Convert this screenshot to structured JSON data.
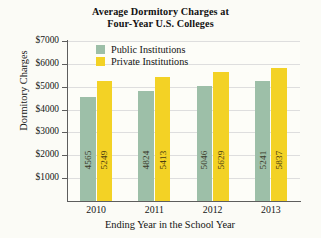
{
  "chart_data": {
    "type": "bar",
    "title": "Average Dormitory Charges at Four-Year U.S. Colleges",
    "title_line1": "Average Dormitory Charges at",
    "title_line2": "Four-Year U.S. Colleges",
    "xlabel": "Ending Year in the School Year",
    "ylabel": "Dormitory Charges",
    "categories": [
      "2010",
      "2011",
      "2012",
      "2013"
    ],
    "ylim": [
      0,
      7000
    ],
    "ytick_values": [
      1000,
      2000,
      3000,
      4000,
      5000,
      6000,
      7000
    ],
    "ytick_labels": [
      "$1000",
      "$2000",
      "$3000",
      "$4000",
      "$5000",
      "$6000",
      "$7000"
    ],
    "grid": true,
    "legend_position": "upper-left-inside",
    "series": [
      {
        "name": "Public Institutions",
        "color": "#9dbfa8",
        "values": [
          4565,
          4824,
          5046,
          5241
        ],
        "labels": [
          "4565",
          "4824",
          "5046",
          "5241"
        ]
      },
      {
        "name": "Private Institutions",
        "color": "#f3d225",
        "values": [
          5249,
          5413,
          5629,
          5837
        ],
        "labels": [
          "5249",
          "5413",
          "5629",
          "5837"
        ]
      }
    ]
  }
}
